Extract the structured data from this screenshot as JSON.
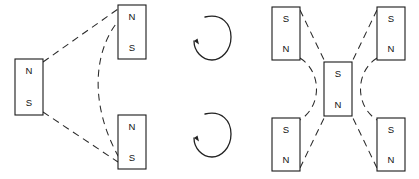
{
  "figure": {
    "background_color": "#ffffff",
    "line_color": "#2a2a2a",
    "stroke_color": "#1a1a1a",
    "width": 419,
    "height": 179
  },
  "left_group": {
    "name": "three-magnet-triangular-arrangement",
    "magnets": [
      {
        "id": "left-magnet",
        "top_pole": "N",
        "bottom_pole": "S",
        "x": 15,
        "y": 59,
        "w": 28,
        "h": 56
      },
      {
        "id": "upper-right-magnet",
        "top_pole": "N",
        "bottom_pole": "S",
        "x": 118,
        "y": 5,
        "w": 28,
        "h": 54
      },
      {
        "id": "lower-right-magnet",
        "top_pole": "N",
        "bottom_pole": "S",
        "x": 118,
        "y": 115,
        "w": 28,
        "h": 54
      }
    ],
    "connectors": [
      {
        "id": "upper-dashed-line",
        "style": "dashed-straight"
      },
      {
        "id": "lower-dashed-line",
        "style": "dashed-straight"
      },
      {
        "id": "left-bulging-dashed-arc",
        "style": "dashed-arc"
      }
    ]
  },
  "rotation_arrows": {
    "name": "rotation-indicators",
    "direction": "counterclockwise",
    "items": [
      {
        "id": "upper-rotation-arrow",
        "cx": 212,
        "cy": 36
      },
      {
        "id": "lower-rotation-arrow",
        "cx": 212,
        "cy": 133
      }
    ]
  },
  "right_group": {
    "name": "five-magnet-cross-arrangement",
    "magnets": [
      {
        "id": "top-left-magnet",
        "top_pole": "S",
        "bottom_pole": "N",
        "x": 272,
        "y": 7,
        "w": 28,
        "h": 53
      },
      {
        "id": "top-right-magnet",
        "top_pole": "S",
        "bottom_pole": "N",
        "x": 377,
        "y": 7,
        "w": 28,
        "h": 53
      },
      {
        "id": "center-magnet",
        "top_pole": "S",
        "bottom_pole": "N",
        "x": 324,
        "y": 62,
        "w": 28,
        "h": 54
      },
      {
        "id": "bottom-left-magnet",
        "top_pole": "S",
        "bottom_pole": "N",
        "x": 272,
        "y": 118,
        "w": 28,
        "h": 53
      },
      {
        "id": "bottom-right-magnet",
        "top_pole": "S",
        "bottom_pole": "N",
        "x": 377,
        "y": 118,
        "w": 28,
        "h": 53
      }
    ],
    "connectors": [
      {
        "id": "top-left-dashed-line",
        "style": "dashed-straight"
      },
      {
        "id": "top-right-dashed-line",
        "style": "dashed-straight"
      },
      {
        "id": "bottom-left-dashed-line",
        "style": "dashed-straight"
      },
      {
        "id": "bottom-right-dashed-line",
        "style": "dashed-straight"
      },
      {
        "id": "left-inner-dashed-arc",
        "style": "dashed-arc"
      },
      {
        "id": "right-inner-dashed-arc",
        "style": "dashed-arc"
      }
    ]
  }
}
